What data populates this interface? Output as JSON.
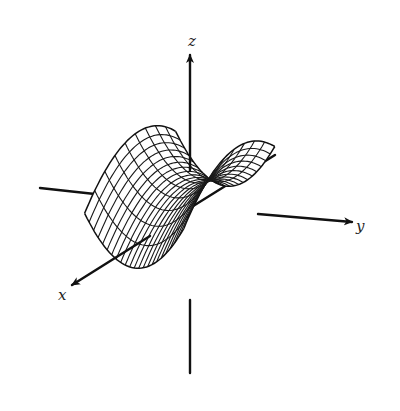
{
  "figure": {
    "type": "3d-surface-diagram",
    "surface": "hyperbolic paraboloid (saddle)",
    "width": 400,
    "height": 411,
    "background": "#ffffff",
    "line_color": "#111111"
  },
  "axes": {
    "origin": [
      190,
      208
    ],
    "z": {
      "label": "z",
      "start": [
        190,
        373
      ],
      "end": [
        190,
        55
      ],
      "label_pos": [
        188,
        46
      ]
    },
    "y": {
      "label": "y",
      "start": [
        40,
        188
      ],
      "end": [
        352,
        222
      ],
      "label_pos": [
        356,
        231
      ]
    },
    "x": {
      "label": "x",
      "start": [
        275,
        155
      ],
      "end": [
        72,
        285
      ],
      "label_pos": [
        58,
        300
      ]
    }
  },
  "surface": {
    "equation": "z = y^2 - x^2",
    "u_lines": 22,
    "v_lines": 9,
    "projection": {
      "origin": [
        190,
        208
      ],
      "x_dir": [
        -1.3,
        0.78
      ],
      "y_dir": [
        1.95,
        0.21
      ],
      "z_dir": [
        0,
        -1
      ]
    },
    "x_range": [
      -28,
      42
    ],
    "y_range": [
      -42,
      40
    ],
    "z_scale": 0.028,
    "z_offset": 22
  }
}
